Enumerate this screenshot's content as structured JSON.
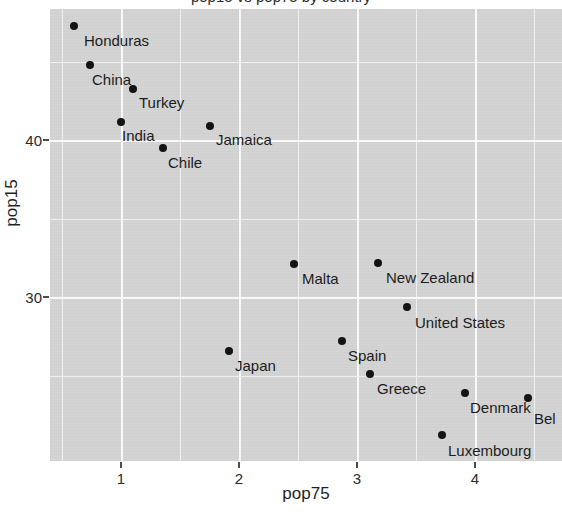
{
  "figure": {
    "title_partial": "pop15 vs pop75 by country",
    "background_color": "#ffffff",
    "panel_color": "#d4d4d4",
    "gridline_color": "#f2f2f2",
    "point_color": "#111111",
    "text_color": "#1f1f1f"
  },
  "axes": {
    "x": {
      "title": "pop75",
      "tick_labels": [
        "1",
        "2",
        "3",
        "4"
      ],
      "tick_values": [
        1,
        2,
        3,
        4
      ]
    },
    "y": {
      "title": "pop15",
      "tick_labels": [
        "30",
        "40"
      ],
      "tick_values": [
        30,
        40
      ]
    }
  },
  "chart_data": {
    "type": "scatter",
    "title": "pop15 vs pop75 by country",
    "xlabel": "pop75",
    "ylabel": "pop15",
    "xlim": [
      0.4,
      4.75
    ],
    "ylim": [
      20.8,
      49.6
    ],
    "xticks": [
      1,
      2,
      3,
      4
    ],
    "yticks": [
      30,
      40
    ],
    "grid": true,
    "legend": "none",
    "x_minor_gridlines": [
      0.5,
      1.5,
      2.5,
      3.5,
      4.5
    ],
    "y_minor_gridlines": [
      25,
      35,
      45,
      49
    ],
    "points": [
      {
        "label": "Honduras",
        "x": 0.6,
        "y": 47.3
      },
      {
        "label": "China",
        "x": 0.74,
        "y": 44.8
      },
      {
        "label": "Turkey",
        "x": 1.1,
        "y": 43.2
      },
      {
        "label": "India",
        "x": 1.0,
        "y": 41.3
      },
      {
        "label": "Jamaica",
        "x": 1.78,
        "y": 41.0
      },
      {
        "label": "Chile",
        "x": 1.32,
        "y": 39.7
      },
      {
        "label": "Malta",
        "x": 2.47,
        "y": 31.9
      },
      {
        "label": "New Zealand",
        "x": 3.17,
        "y": 32.0
      },
      {
        "label": "United States",
        "x": 3.43,
        "y": 29.3
      },
      {
        "label": "Spain",
        "x": 2.87,
        "y": 25.9
      },
      {
        "label": "Japan",
        "x": 1.92,
        "y": 25.3
      },
      {
        "label": "Greece",
        "x": 3.1,
        "y": 23.9
      },
      {
        "label": "Denmark",
        "x": 3.93,
        "y": 22.7
      },
      {
        "label": "Bel",
        "x": 4.47,
        "y": 22.4
      },
      {
        "label": "Luxembourg",
        "x": 3.72,
        "y": 20.1
      }
    ]
  },
  "point_pixels": [
    {
      "label": "Honduras",
      "px": 74,
      "py": 26,
      "lx": 84,
      "ly": 33
    },
    {
      "label": "China",
      "px": 90,
      "py": 65,
      "lx": 92,
      "ly": 72
    },
    {
      "label": "Turkey",
      "px": 133,
      "py": 89,
      "lx": 139,
      "ly": 95
    },
    {
      "label": "India",
      "px": 121,
      "py": 122,
      "lx": 122,
      "ly": 128
    },
    {
      "label": "Jamaica",
      "px": 210,
      "py": 126,
      "lx": 216,
      "ly": 132
    },
    {
      "label": "Chile",
      "px": 163,
      "py": 148,
      "lx": 168,
      "ly": 155
    },
    {
      "label": "Malta",
      "px": 294,
      "py": 264,
      "lx": 302,
      "ly": 271
    },
    {
      "label": "New Zealand",
      "px": 378,
      "py": 263,
      "lx": 386,
      "ly": 270
    },
    {
      "label": "United States",
      "px": 407,
      "py": 307,
      "lx": 415,
      "ly": 315
    },
    {
      "label": "Spain",
      "px": 342,
      "py": 341,
      "lx": 348,
      "ly": 348
    },
    {
      "label": "Japan",
      "px": 229,
      "py": 351,
      "lx": 235,
      "ly": 358
    },
    {
      "label": "Greece",
      "px": 370,
      "py": 374,
      "lx": 377,
      "ly": 381
    },
    {
      "label": "Denmark",
      "px": 465,
      "py": 393,
      "lx": 470,
      "ly": 400
    },
    {
      "label": "Bel",
      "px": 528,
      "py": 398,
      "lx": 534,
      "ly": 411
    },
    {
      "label": "Luxembourg",
      "px": 442,
      "py": 435,
      "lx": 448,
      "ly": 443
    }
  ]
}
